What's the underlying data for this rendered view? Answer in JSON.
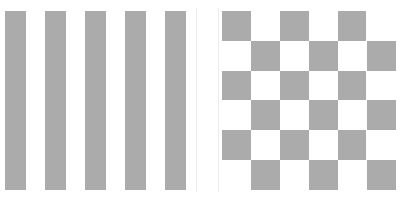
{
  "figure": {
    "title": "",
    "width": 416,
    "height": 200,
    "background_color": "#ffffff",
    "panel_count": 2
  },
  "colors": {
    "foreground_gray": "#ababab",
    "background_white": "#ffffff",
    "seam_line": "#fdfdfd",
    "panel_edge": "#ececec"
  },
  "chart_data": [
    {
      "type": "heatmap",
      "name": "vertical-stripes",
      "title": "",
      "subtitle": "",
      "xlabel": "",
      "ylabel": "",
      "grid": false,
      "legend": "none",
      "description": "Binary vertical stripe pattern: 5 filled gray stripes separated by white gaps, spanning the full plot height.",
      "rows": 1,
      "cols": 9,
      "cell_values": [
        [
          1,
          0,
          1,
          0,
          1,
          0,
          1,
          0,
          1
        ]
      ],
      "value_colors": {
        "0": "#ffffff",
        "1": "#ababab"
      },
      "stripe_bands": [
        {
          "index": 0,
          "value": 1,
          "x_start": 0,
          "x_width": 21
        },
        {
          "index": 1,
          "value": 0,
          "x_start": 21,
          "x_width": 19
        },
        {
          "index": 2,
          "value": 1,
          "x_start": 40,
          "x_width": 21
        },
        {
          "index": 3,
          "value": 0,
          "x_start": 61,
          "x_width": 19
        },
        {
          "index": 4,
          "value": 1,
          "x_start": 80,
          "x_width": 21
        },
        {
          "index": 5,
          "value": 0,
          "x_start": 101,
          "x_width": 19
        },
        {
          "index": 6,
          "value": 1,
          "x_start": 120,
          "x_width": 21
        },
        {
          "index": 7,
          "value": 0,
          "x_start": 141,
          "x_width": 19
        },
        {
          "index": 8,
          "value": 1,
          "x_start": 160,
          "x_width": 21
        }
      ],
      "xlim": [
        0,
        191
      ],
      "ylim": [
        0,
        179
      ]
    },
    {
      "type": "heatmap",
      "name": "checkerboard",
      "title": "",
      "subtitle": "",
      "xlabel": "",
      "ylabel": "",
      "grid": false,
      "legend": "none",
      "description": "6 by 6 binary checkerboard starting with a filled gray cell at the top-left, with a faint vertical seam line through the fifth column.",
      "rows": 6,
      "cols": 6,
      "cell_values": [
        [
          1,
          0,
          1,
          0,
          1,
          0
        ],
        [
          0,
          1,
          0,
          1,
          0,
          1
        ],
        [
          1,
          0,
          1,
          0,
          1,
          0
        ],
        [
          0,
          1,
          0,
          1,
          0,
          1
        ],
        [
          1,
          0,
          1,
          0,
          1,
          0
        ],
        [
          0,
          1,
          0,
          1,
          0,
          1
        ]
      ],
      "value_colors": {
        "0": "#ffffff",
        "1": "#ababab"
      },
      "cell_width": 29,
      "cell_height": 29.8,
      "seam_column_index": 4,
      "seam_offset_x": 144,
      "xlim": [
        0,
        180
      ],
      "ylim": [
        0,
        179
      ]
    }
  ]
}
